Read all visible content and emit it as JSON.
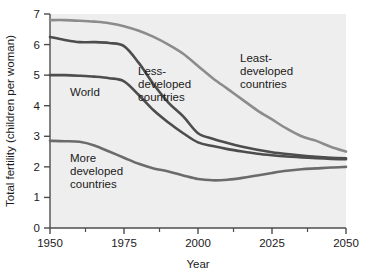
{
  "chart_data": {
    "type": "line",
    "title": "",
    "xlabel": "Year",
    "ylabel": "Total fertility (children per woman)",
    "xlim": [
      1950,
      2050
    ],
    "ylim": [
      0,
      7
    ],
    "grid": false,
    "legend_position": "inline-annotations",
    "x_ticks": [
      1950,
      1975,
      2000,
      2025,
      2050
    ],
    "x_tick_labels": [
      "1950",
      "1975",
      "2000",
      "2025",
      "2050"
    ],
    "x_minor_ticks": [
      1962,
      1987,
      2012,
      2037
    ],
    "y_ticks": [
      0,
      1,
      2,
      3,
      4,
      5,
      6,
      7
    ],
    "y_tick_labels": [
      "0",
      "1",
      "2",
      "3",
      "4",
      "5",
      "6",
      "7"
    ],
    "x": [
      1950,
      1955,
      1960,
      1965,
      1970,
      1975,
      1980,
      1985,
      1990,
      1995,
      2000,
      2005,
      2010,
      2015,
      2020,
      2025,
      2030,
      2035,
      2040,
      2045,
      2050
    ],
    "series": [
      {
        "name": "Least-developed countries",
        "color": "#8c8c8c",
        "width": 2.6,
        "values": [
          6.8,
          6.8,
          6.78,
          6.75,
          6.7,
          6.6,
          6.45,
          6.25,
          6.0,
          5.7,
          5.3,
          4.9,
          4.55,
          4.2,
          3.85,
          3.55,
          3.25,
          3.0,
          2.85,
          2.65,
          2.5
        ]
      },
      {
        "name": "Less-developed countries",
        "color": "#4d4d4d",
        "width": 2.6,
        "values": [
          6.25,
          6.15,
          6.08,
          6.08,
          6.05,
          5.95,
          5.4,
          4.7,
          4.1,
          3.65,
          3.1,
          2.92,
          2.78,
          2.66,
          2.56,
          2.48,
          2.42,
          2.37,
          2.33,
          2.3,
          2.28
        ]
      },
      {
        "name": "World",
        "color": "#4d4d4d",
        "width": 2.6,
        "values": [
          5.0,
          5.0,
          4.98,
          4.95,
          4.9,
          4.8,
          4.35,
          3.85,
          3.45,
          3.1,
          2.8,
          2.68,
          2.58,
          2.5,
          2.43,
          2.38,
          2.34,
          2.31,
          2.28,
          2.26,
          2.25
        ]
      },
      {
        "name": "More developed countries",
        "color": "#6b6b6b",
        "width": 2.6,
        "values": [
          2.85,
          2.84,
          2.82,
          2.7,
          2.5,
          2.3,
          2.1,
          1.95,
          1.85,
          1.72,
          1.6,
          1.56,
          1.58,
          1.64,
          1.72,
          1.8,
          1.87,
          1.92,
          1.95,
          1.98,
          2.0
        ]
      }
    ],
    "annotations": [
      {
        "name": "world-label",
        "text": "World",
        "lines": [
          "World"
        ],
        "x_px": 70,
        "y_px": 96
      },
      {
        "name": "less-developed-label",
        "text": "Less- developed countries",
        "lines": [
          "Less-",
          "developed",
          "countries"
        ],
        "x_px": 138,
        "y_px": 75
      },
      {
        "name": "least-developed-label",
        "text": "Least- developed countries",
        "lines": [
          "Least-",
          "developed",
          "countries"
        ],
        "x_px": 240,
        "y_px": 62
      },
      {
        "name": "more-developed-label",
        "text": "More developed countries",
        "lines": [
          "More",
          "developed",
          "countries"
        ],
        "x_px": 70,
        "y_px": 162
      }
    ]
  },
  "axes": {
    "x_title": "Year",
    "y_title": "Total fertility (children per woman)",
    "plot_bg": "#eeeeee",
    "axis_color": "#4d4d4d"
  }
}
